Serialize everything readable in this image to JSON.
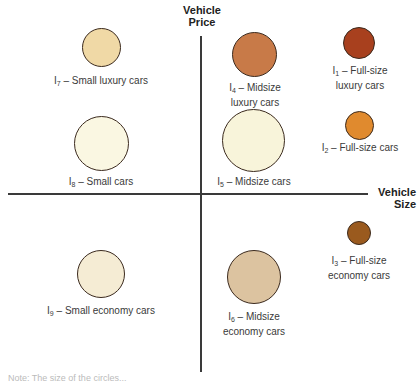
{
  "axes": {
    "y_label_line1": "Vehicle",
    "y_label_line2": "Price",
    "x_label_line1": "Vehicle",
    "x_label_line2": "Size"
  },
  "items": [
    {
      "id": "I1",
      "sub": "1",
      "text1": " – Full-size",
      "text2": "luxury cars",
      "color": "#a8401e"
    },
    {
      "id": "I2",
      "sub": "2",
      "text1": " – Full-size cars",
      "text2": "",
      "color": "#e08a2e"
    },
    {
      "id": "I3",
      "sub": "3",
      "text1": " – Full-size",
      "text2": "economy cars",
      "color": "#9a5a1e"
    },
    {
      "id": "I4",
      "sub": "4",
      "text1": " – Midsize",
      "text2": "luxury cars",
      "color": "#c87a48"
    },
    {
      "id": "I5",
      "sub": "5",
      "text1": " – Midsize cars",
      "text2": "",
      "color": "#f8f4da"
    },
    {
      "id": "I6",
      "sub": "6",
      "text1": " – Midsize",
      "text2": "economy cars",
      "color": "#dcc3a0"
    },
    {
      "id": "I7",
      "sub": "7",
      "text1": " – Small luxury cars",
      "text2": "",
      "color": "#f0d9a6"
    },
    {
      "id": "I8",
      "sub": "8",
      "text1": " –  Small cars",
      "text2": "",
      "color": "#faf7e2"
    },
    {
      "id": "I9",
      "sub": "9",
      "text1": " – Small economy cars",
      "text2": "",
      "color": "#f5ecd4"
    }
  ],
  "note": "Note: The size of the circles..."
}
